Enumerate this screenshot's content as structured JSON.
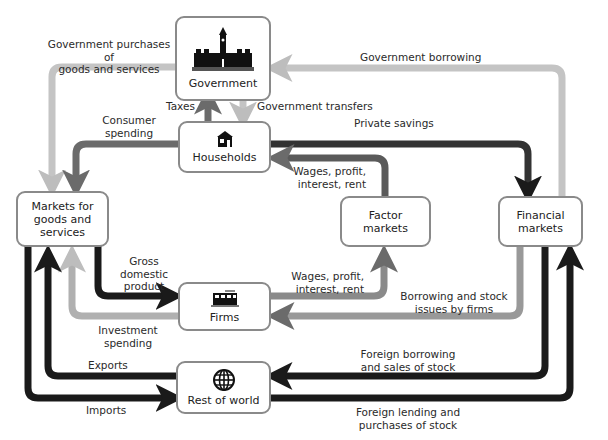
{
  "colors": {
    "dark": "#1a1a1a",
    "medium": "#6b6b6b",
    "light": "#bdbdbd",
    "box_border": "#8a8a8a"
  },
  "sectors": {
    "government": {
      "label": "Government",
      "icon": "parliament-building-icon"
    },
    "households": {
      "label": "Households",
      "icon": "house-icon"
    },
    "markets_goods": {
      "label": "Markets for\ngoods and\nservices"
    },
    "factor_markets": {
      "label": "Factor\nmarkets"
    },
    "financial_markets": {
      "label": "Financial\nmarkets"
    },
    "firms": {
      "label": "Firms",
      "icon": "factory-building-icon"
    },
    "rest_of_world": {
      "label": "Rest of world",
      "icon": "globe-icon"
    }
  },
  "flows": {
    "gov_purchases": "Government purchases of\ngoods and services",
    "gov_borrowing": "Government borrowing",
    "taxes": "Taxes",
    "gov_transfers": "Government transfers",
    "consumer_spending": "Consumer\nspending",
    "private_savings": "Private savings",
    "wages_to_households": "Wages, profit,\ninterest, rent",
    "gdp": "Gross\ndomestic\nproduct",
    "wages_from_firms": "Wages, profit,\ninterest, rent",
    "borrowing_stock": "Borrowing and stock\nissues by firms",
    "investment_spending": "Investment\nspending",
    "exports": "Exports",
    "imports": "Imports",
    "foreign_borrowing": "Foreign borrowing\nand sales of stock",
    "foreign_lending": "Foreign lending and\npurchases of stock"
  }
}
